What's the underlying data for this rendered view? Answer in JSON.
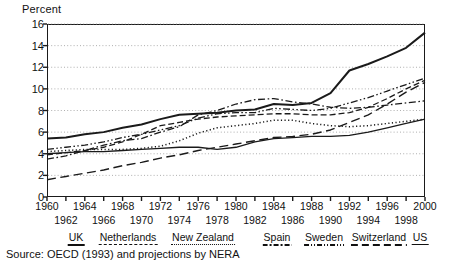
{
  "axis_title": "Percent",
  "source_note": "Source:  OECD (1993) and projections by NERA",
  "legend": {
    "items": [
      {
        "label": "UK",
        "style": "bold"
      },
      {
        "label": "Netherlands",
        "style": "dashed"
      },
      {
        "label": "New Zealand",
        "style": "dotted"
      },
      {
        "label": "Spain",
        "style": "dashdot"
      },
      {
        "label": "Sweden",
        "style": "dashdotdot"
      },
      {
        "label": "Switzerland",
        "style": "longdash"
      },
      {
        "label": "US",
        "style": "solid"
      }
    ]
  },
  "chart_data": {
    "type": "line",
    "title": "",
    "xlabel": "",
    "ylabel": "Percent",
    "xlim": [
      1960,
      2000
    ],
    "ylim": [
      0,
      16
    ],
    "yticks": [
      0,
      2,
      4,
      6,
      8,
      10,
      12,
      14,
      16
    ],
    "xticks": [
      1960,
      1962,
      1964,
      1966,
      1968,
      1970,
      1972,
      1974,
      1976,
      1978,
      1980,
      1982,
      1984,
      1986,
      1988,
      1990,
      1992,
      1994,
      1996,
      1998,
      2000
    ],
    "xticks_top": [
      1960,
      1964,
      1968,
      1972,
      1976,
      1980,
      1984,
      1988,
      1992,
      1996,
      2000
    ],
    "xticks_bottom": [
      1962,
      1966,
      1970,
      1974,
      1978,
      1982,
      1986,
      1990,
      1994,
      1998
    ],
    "grid": "horizontal-dotted",
    "legend_position": "below",
    "x": [
      1960,
      1962,
      1964,
      1966,
      1968,
      1970,
      1972,
      1974,
      1976,
      1978,
      1980,
      1982,
      1984,
      1986,
      1988,
      1990,
      1992,
      1994,
      1996,
      1998,
      2000
    ],
    "series": [
      {
        "name": "UK",
        "style": "bold",
        "color": "#1a1a1a",
        "values": [
          5.4,
          5.5,
          5.8,
          6.0,
          6.4,
          6.7,
          7.2,
          7.6,
          7.7,
          7.8,
          8.0,
          8.1,
          8.6,
          8.5,
          8.7,
          9.6,
          11.7,
          12.3,
          13.0,
          13.8,
          15.2
        ]
      },
      {
        "name": "Netherlands",
        "style": "dashed",
        "color": "#1a1a1a",
        "values": [
          3.9,
          4.1,
          4.3,
          4.6,
          5.1,
          5.8,
          6.6,
          6.9,
          7.2,
          7.4,
          7.5,
          7.6,
          7.7,
          7.7,
          7.6,
          7.6,
          7.8,
          8.3,
          9.1,
          10.0,
          10.8
        ]
      },
      {
        "name": "New Zealand",
        "style": "dotted",
        "color": "#1a1a1a",
        "values": [
          4.2,
          4.3,
          4.4,
          4.4,
          4.4,
          4.5,
          4.7,
          5.2,
          5.9,
          6.4,
          6.6,
          6.8,
          7.1,
          7.1,
          6.8,
          6.6,
          6.5,
          6.6,
          6.8,
          7.0,
          7.2
        ]
      },
      {
        "name": "Spain",
        "style": "dashdot",
        "color": "#1a1a1a",
        "values": [
          3.5,
          3.8,
          4.3,
          4.8,
          5.2,
          5.4,
          6.0,
          6.5,
          7.6,
          8.0,
          8.6,
          9.0,
          9.1,
          8.8,
          8.6,
          8.3,
          8.2,
          8.3,
          8.5,
          8.7,
          8.9
        ]
      },
      {
        "name": "Sweden",
        "style": "dashdotdot",
        "color": "#1a1a1a",
        "values": [
          4.4,
          4.6,
          4.8,
          5.1,
          5.5,
          5.8,
          6.2,
          6.6,
          7.3,
          7.7,
          7.8,
          7.8,
          8.2,
          8.1,
          8.0,
          8.2,
          8.7,
          9.2,
          9.8,
          10.4,
          11.0
        ]
      },
      {
        "name": "Switzerland",
        "style": "longdash",
        "color": "#1a1a1a",
        "values": [
          1.6,
          1.9,
          2.2,
          2.5,
          2.9,
          3.2,
          3.6,
          3.9,
          4.3,
          4.6,
          4.9,
          5.2,
          5.5,
          5.6,
          5.8,
          6.2,
          6.9,
          7.6,
          8.6,
          9.7,
          10.6
        ]
      },
      {
        "name": "US",
        "style": "solid",
        "color": "#1a1a1a",
        "values": [
          4.0,
          4.1,
          4.2,
          4.2,
          4.3,
          4.4,
          4.5,
          4.6,
          4.6,
          4.4,
          4.6,
          5.1,
          5.4,
          5.5,
          5.6,
          5.6,
          5.7,
          6.0,
          6.4,
          6.8,
          7.2
        ]
      }
    ]
  }
}
